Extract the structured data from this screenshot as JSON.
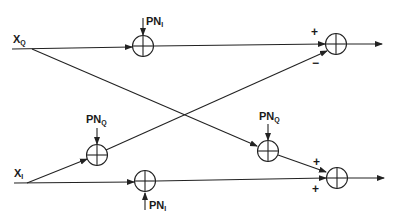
{
  "diagram": {
    "type": "signal-flow block diagram (phase noise cross-coupling)",
    "inputs": [
      {
        "id": "xq",
        "main": "X",
        "sub": "Q"
      },
      {
        "id": "xi",
        "main": "X",
        "sub": "I"
      }
    ],
    "multipliers": [
      {
        "id": "m_top",
        "noise": {
          "main": "PN",
          "sub": "I"
        }
      },
      {
        "id": "m_left_q",
        "noise": {
          "main": "PN",
          "sub": "Q"
        }
      },
      {
        "id": "m_right_q",
        "noise": {
          "main": "PN",
          "sub": "Q"
        }
      },
      {
        "id": "m_bottom",
        "noise": {
          "main": "PN",
          "sub": "I"
        }
      }
    ],
    "summers": [
      {
        "id": "sum_top",
        "signs": {
          "upper": "+",
          "lower": "−"
        }
      },
      {
        "id": "sum_bottom",
        "signs": {
          "upper": "+",
          "lower": "+"
        }
      }
    ],
    "colors": {
      "stroke": "#222222",
      "background": "#ffffff"
    }
  }
}
